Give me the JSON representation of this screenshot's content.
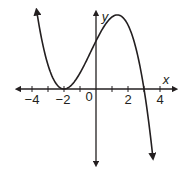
{
  "chart_data": {
    "type": "line",
    "title": "",
    "xlabel": "x",
    "ylabel": "y",
    "x_ticks": [
      -4,
      -3,
      -2,
      -1,
      0,
      1,
      2,
      3,
      4
    ],
    "x_tick_labels": [
      "−4",
      "−2",
      "0",
      "2",
      "4"
    ],
    "x_tick_label_values": [
      -4,
      -2,
      0,
      2,
      4
    ],
    "xlim": [
      -4.5,
      4.5
    ],
    "ylim": [
      -5,
      5
    ],
    "grid": false,
    "series": [
      {
        "name": "f(x)",
        "description": "cubic with double root at x=-2 and root at x=3; y-intercept 3; local max near x=1.33",
        "equation": "y = -0.25(x+2)^2(x-3)",
        "x": [
          -3.7,
          -3,
          -2,
          -1,
          0,
          1,
          1.33,
          2,
          3,
          3.5
        ],
        "y": [
          4.75,
          1.5,
          0,
          1,
          3,
          4.5,
          4.63,
          4,
          0,
          -2.53
        ]
      }
    ],
    "key_points": {
      "double_root": [
        -2,
        0
      ],
      "root": [
        3,
        0
      ],
      "y_intercept": [
        0,
        3
      ]
    }
  },
  "labels": {
    "x_axis": "x",
    "y_axis": "y",
    "t_neg4": "−4",
    "t_neg2": "−2",
    "t_0": "0",
    "t_2": "2",
    "t_4": "4"
  }
}
